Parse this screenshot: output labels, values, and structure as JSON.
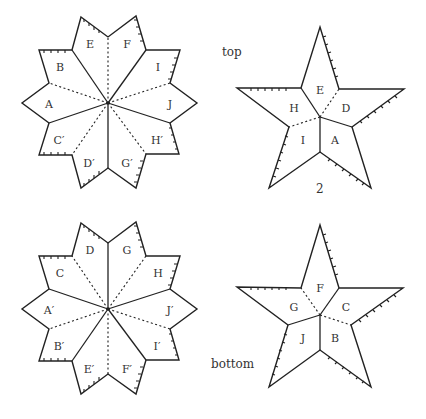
{
  "diagram": {
    "captions": {
      "top": "top",
      "bottom": "bottom",
      "figure_number": "2"
    },
    "top_flower": {
      "labels": [
        "E",
        "F",
        "I",
        "J",
        "H′",
        "G′",
        "D′",
        "C′",
        "A",
        "B"
      ]
    },
    "bottom_flower": {
      "labels": [
        "D",
        "G",
        "H",
        "J′",
        "I′",
        "F′",
        "E′",
        "B′",
        "A′",
        "C"
      ]
    },
    "top_star": {
      "labels": [
        "E",
        "D",
        "A",
        "I",
        "H"
      ]
    },
    "bottom_star": {
      "labels": [
        "F",
        "C",
        "B",
        "J",
        "G"
      ]
    }
  }
}
